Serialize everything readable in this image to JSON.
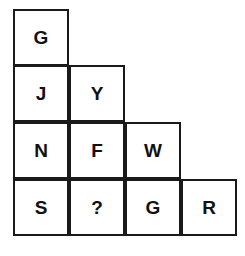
{
  "puzzle": {
    "rows": [
      [
        "G"
      ],
      [
        "J",
        "Y"
      ],
      [
        "N",
        "F",
        "W"
      ],
      [
        "S",
        "?",
        "G",
        "R"
      ]
    ]
  }
}
